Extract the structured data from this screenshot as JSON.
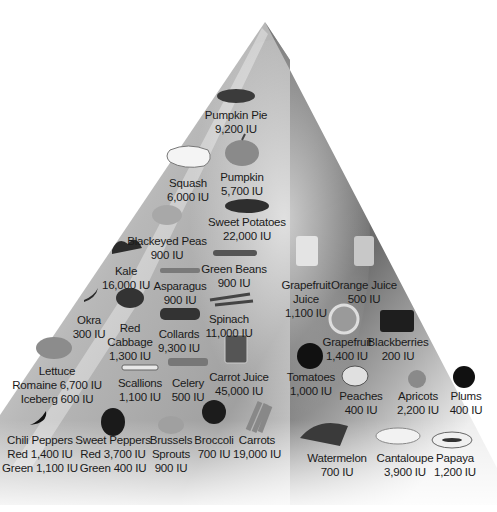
{
  "diagram": {
    "type": "food-pyramid",
    "unit": "IU",
    "colors": {
      "left_face_light": "#f2f2f2",
      "left_face_dark": "#9a9a9a",
      "right_face_dark": "#5e5e5e",
      "right_face_light": "#e8e8e8",
      "text": "#1a1a1a"
    },
    "items": [
      {
        "id": "pumpkin-pie",
        "lines": [
          "Pumpkin Pie",
          "9,200 IU"
        ],
        "x": 236,
        "y": 108,
        "icon": "pie-icon"
      },
      {
        "id": "pumpkin",
        "lines": [
          "Pumpkin",
          "5,700 IU"
        ],
        "x": 242,
        "y": 170,
        "icon": "pumpkin-icon"
      },
      {
        "id": "squash",
        "lines": [
          "Squash",
          "6,000 IU"
        ],
        "x": 188,
        "y": 176,
        "icon": "squash-icon"
      },
      {
        "id": "sweet-potatoes",
        "lines": [
          "Sweet Potatoes",
          "22,000 IU"
        ],
        "x": 247,
        "y": 215,
        "icon": "sweet-potato-icon"
      },
      {
        "id": "blackeyed-peas",
        "lines": [
          "Blackeyed Peas",
          "900 IU"
        ],
        "x": 167,
        "y": 234,
        "icon": "peas-icon"
      },
      {
        "id": "kale",
        "lines": [
          "Kale",
          "16,000 IU"
        ],
        "x": 126,
        "y": 264,
        "icon": "kale-icon"
      },
      {
        "id": "green-beans",
        "lines": [
          "Green Beans",
          "900 IU"
        ],
        "x": 234,
        "y": 262,
        "icon": "green-beans-icon"
      },
      {
        "id": "asparagus",
        "lines": [
          "Asparagus",
          "900 IU"
        ],
        "x": 180,
        "y": 279,
        "icon": "asparagus-icon"
      },
      {
        "id": "okra",
        "lines": [
          "Okra",
          "300 IU"
        ],
        "x": 89,
        "y": 313,
        "icon": "okra-icon"
      },
      {
        "id": "red-cabbage",
        "lines": [
          "Red",
          "Cabbage",
          "1,300 IU"
        ],
        "x": 130,
        "y": 321,
        "icon": "cabbage-icon"
      },
      {
        "id": "collards",
        "lines": [
          "Collards",
          "9,300 IU"
        ],
        "x": 179,
        "y": 327,
        "icon": "collards-icon"
      },
      {
        "id": "spinach",
        "lines": [
          "Spinach",
          "11,000 IU"
        ],
        "x": 229,
        "y": 312,
        "icon": "spinach-icon"
      },
      {
        "id": "lettuce",
        "lines": [
          "Lettuce",
          "Romaine 6,700 IU",
          "Iceberg 600 IU"
        ],
        "x": 57,
        "y": 364,
        "icon": "lettuce-icon"
      },
      {
        "id": "scallions",
        "lines": [
          "Scallions",
          "1,100 IU"
        ],
        "x": 140,
        "y": 376,
        "icon": "scallions-icon"
      },
      {
        "id": "celery",
        "lines": [
          "Celery",
          "500 IU"
        ],
        "x": 188,
        "y": 376,
        "icon": "celery-icon"
      },
      {
        "id": "carrot-juice",
        "lines": [
          "Carrot Juice",
          "45,000 IU"
        ],
        "x": 239,
        "y": 370,
        "icon": "juice-glass-icon"
      },
      {
        "id": "chili-peppers",
        "lines": [
          "Chili Peppers",
          "Red 1,400 IU",
          "Green 1,100 IU"
        ],
        "x": 40,
        "y": 433,
        "icon": "chili-icon"
      },
      {
        "id": "sweet-peppers",
        "lines": [
          "Sweet Peppers",
          "Red 3,700 IU",
          "Green 400 IU"
        ],
        "x": 113,
        "y": 433,
        "icon": "bell-pepper-icon"
      },
      {
        "id": "brussels-sprouts",
        "lines": [
          "Brussels",
          "Sprouts",
          "900 IU"
        ],
        "x": 171,
        "y": 433,
        "icon": "brussels-icon"
      },
      {
        "id": "broccoli",
        "lines": [
          "Broccoli",
          "700 IU"
        ],
        "x": 214,
        "y": 433,
        "icon": "broccoli-icon"
      },
      {
        "id": "carrots",
        "lines": [
          "Carrots",
          "19,000 IU"
        ],
        "x": 257,
        "y": 433,
        "icon": "carrot-icon"
      },
      {
        "id": "grapefruit-juice",
        "lines": [
          "Grapefruit",
          "Juice",
          "1,100 IU"
        ],
        "x": 306,
        "y": 278,
        "icon": "juice-glass-icon"
      },
      {
        "id": "orange-juice",
        "lines": [
          "Orange Juice",
          "500 IU"
        ],
        "x": 364,
        "y": 278,
        "icon": "juice-glass-icon"
      },
      {
        "id": "grapefruit",
        "lines": [
          "Grapefruit",
          "1,400 IU"
        ],
        "x": 347,
        "y": 335,
        "icon": "grapefruit-icon"
      },
      {
        "id": "blackberries",
        "lines": [
          "Blackberries",
          "200 IU"
        ],
        "x": 398,
        "y": 335,
        "icon": "blackberries-icon"
      },
      {
        "id": "tomatoes",
        "lines": [
          "Tomatoes",
          "1,000 IU"
        ],
        "x": 311,
        "y": 370,
        "icon": "tomato-icon"
      },
      {
        "id": "peaches",
        "lines": [
          "Peaches",
          "400 IU"
        ],
        "x": 361,
        "y": 389,
        "icon": "peach-icon"
      },
      {
        "id": "apricots",
        "lines": [
          "Apricots",
          "2,200 IU"
        ],
        "x": 418,
        "y": 389,
        "icon": "apricot-icon"
      },
      {
        "id": "plums",
        "lines": [
          "Plums",
          "400 IU"
        ],
        "x": 466,
        "y": 389,
        "icon": "plum-icon"
      },
      {
        "id": "watermelon",
        "lines": [
          "Watermelon",
          "700 IU"
        ],
        "x": 337,
        "y": 451,
        "icon": "watermelon-icon"
      },
      {
        "id": "cantaloupe",
        "lines": [
          "Cantaloupe",
          "3,900 IU"
        ],
        "x": 405,
        "y": 451,
        "icon": "cantaloupe-icon"
      },
      {
        "id": "papaya",
        "lines": [
          "Papaya",
          "1,200 IU"
        ],
        "x": 455,
        "y": 451,
        "icon": "papaya-icon"
      }
    ]
  }
}
